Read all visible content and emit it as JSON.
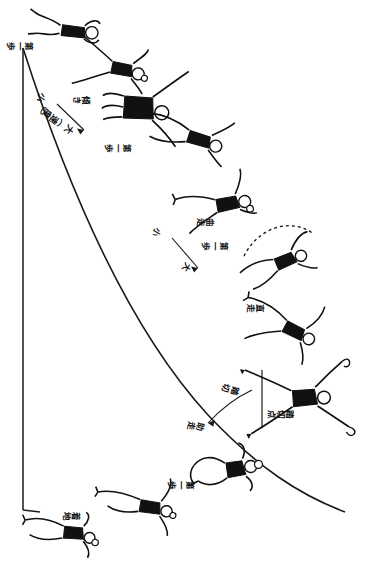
{
  "figure": {
    "kind": "athletics-instructional-diagram",
    "language": "ja",
    "orientation_note": "page rotated 90 degrees clockwise; captions read vertically",
    "background_color": "#ffffff",
    "ink_color": "#111111",
    "width": 366,
    "height": 568
  },
  "labels": {
    "speed_axis": "小 ——→ 大（速度）",
    "speed_axis_small": "小",
    "speed_axis_large": "大（速度）",
    "first_step_a": "第一歩",
    "first_step_b": "第一歩",
    "first_step_c": "第一歩",
    "first_step_d": "第一歩",
    "lean_a": "傾き",
    "lean_b": "傾き",
    "curve_in": "曲走",
    "curve_out": "直走",
    "takeoff": "踏切",
    "takeoff_point": "踏切点",
    "arc_small": "小",
    "arc_large": "大",
    "start": "助走",
    "plant": "着地"
  },
  "caption_items": [
    {
      "id": "lbl-first-step-top",
      "text": "第一歩",
      "x": 33,
      "y": 40,
      "rotate": 90,
      "size": 8.5
    },
    {
      "id": "lbl-lean-top",
      "text": "傾き",
      "x": 90,
      "y": 94,
      "rotate": 90,
      "size": 8.5
    },
    {
      "id": "lbl-speed-small",
      "text": "小",
      "x": 48,
      "y": 96,
      "rotate": 125,
      "size": 9
    },
    {
      "id": "lbl-speed-large",
      "text": "大（速度）",
      "x": 72,
      "y": 131,
      "rotate": 125,
      "size": 9
    },
    {
      "id": "lbl-lean-mid",
      "text": "傾き",
      "x": 129,
      "y": 145,
      "rotate": 90,
      "size": 8.5
    },
    {
      "id": "lbl-curve-small",
      "text": "小",
      "x": 163,
      "y": 229,
      "rotate": 120,
      "size": 8.5
    },
    {
      "id": "lbl-curve-large",
      "text": "大",
      "x": 191,
      "y": 265,
      "rotate": 120,
      "size": 8.5
    },
    {
      "id": "lbl-takeoff-upper",
      "text": "踏切",
      "x": 212,
      "y": 219,
      "rotate": 90,
      "size": 8.5
    },
    {
      "id": "lbl-curve-run",
      "text": "曲走",
      "x": 226,
      "y": 243,
      "rotate": 90,
      "size": 8.5
    },
    {
      "id": "lbl-straight-run",
      "text": "直走",
      "x": 262,
      "y": 305,
      "rotate": 90,
      "size": 8.5
    },
    {
      "id": "lbl-arc-mark",
      "text": "踏切",
      "x": 238,
      "y": 390,
      "rotate": 105,
      "size": 8.5
    },
    {
      "id": "lbl-arc-out",
      "text": "助走",
      "x": 203,
      "y": 425,
      "rotate": 100,
      "size": 8.5
    },
    {
      "id": "lbl-takeoff-point",
      "text": "踏切点",
      "x": 292,
      "y": 412,
      "rotate": 90,
      "size": 8.5
    },
    {
      "id": "lbl-first-step-lower",
      "text": "第一歩",
      "x": 192,
      "y": 482,
      "rotate": 90,
      "size": 8.5
    },
    {
      "id": "lbl-start-bottom",
      "text": "助走",
      "x": 78,
      "y": 513,
      "rotate": 90,
      "size": 8.5
    }
  ],
  "figures": [
    {
      "id": "athlete-1",
      "pose": "running-lean",
      "cx": 72,
      "cy": 30
    },
    {
      "id": "athlete-2",
      "pose": "running-arms-out",
      "cx": 120,
      "cy": 68
    },
    {
      "id": "athlete-3",
      "pose": "running-upright",
      "cx": 138,
      "cy": 108
    },
    {
      "id": "athlete-4",
      "pose": "running-stride",
      "cx": 197,
      "cy": 139
    },
    {
      "id": "athlete-5",
      "pose": "running-lean-back",
      "cx": 225,
      "cy": 205
    },
    {
      "id": "athlete-6",
      "pose": "curved-arc-jump",
      "cx": 283,
      "cy": 262
    },
    {
      "id": "athlete-7",
      "pose": "takeoff-leg-drive",
      "cx": 292,
      "cy": 330
    },
    {
      "id": "athlete-8",
      "pose": "spread-flight",
      "cx": 303,
      "cy": 398
    },
    {
      "id": "athlete-9",
      "pose": "landing-step",
      "cx": 233,
      "cy": 470
    },
    {
      "id": "athlete-10",
      "pose": "running-start",
      "cx": 148,
      "cy": 507
    },
    {
      "id": "athlete-11",
      "pose": "low-start",
      "cx": 72,
      "cy": 533
    }
  ],
  "geometry": {
    "vertical_line_label": "approach-baseline",
    "curve_label": "run-up-curve",
    "diagonal_label": "speed-gradient-line"
  }
}
